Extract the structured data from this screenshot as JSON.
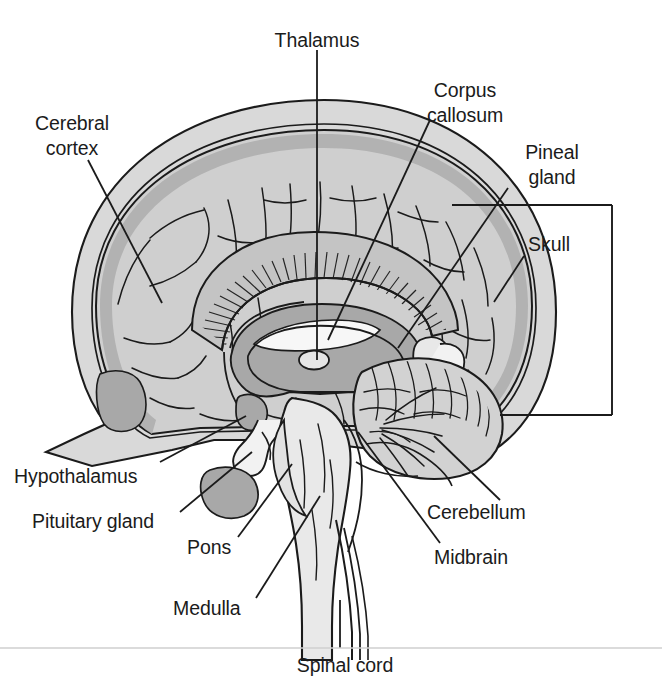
{
  "figure": {
    "background_color": "#ffffff",
    "divider_color": "#cfcfcf",
    "line_color": "#1b1b1b",
    "palette": {
      "skull_fill": "#d9d9d9",
      "cerebrum_fill": "#cfcfcf",
      "cortex_ribbon": "#b3b3b3",
      "deep_gray": "#a8a8a8",
      "corpus_callosum_fill": "#c4c4c4",
      "brainstem_fill": "#e8e8e8",
      "cerebellum_fill": "#d2d2d2",
      "ventricle_white": "#f5f5f5"
    }
  },
  "labels": {
    "cerebral_cortex": {
      "line1": "Cerebral",
      "line2": "cortex"
    },
    "thalamus": "Thalamus",
    "corpus_callosum": {
      "line1": "Corpus",
      "line2": "callosum"
    },
    "pineal_gland": {
      "line1": "Pineal",
      "line2": "gland"
    },
    "skull": "Skull",
    "cerebrum": "Cerebrum",
    "hypothalamus": "Hypothalamus",
    "pituitary_gland": "Pituitary gland",
    "pons": "Pons",
    "medulla": "Medulla",
    "spinal_cord": "Spinal cord",
    "cerebellum": "Cerebellum",
    "midbrain": "Midbrain"
  },
  "structures": [
    {
      "name": "Cerebral cortex",
      "region": "outer layer of cerebrum, left anterior"
    },
    {
      "name": "Thalamus",
      "region": "central, deep gray mass"
    },
    {
      "name": "Corpus callosum",
      "region": "arched hatched band above thalamus"
    },
    {
      "name": "Pineal gland",
      "region": "posterior to thalamus"
    },
    {
      "name": "Skull",
      "region": "outer bone band enclosing brain"
    },
    {
      "name": "Cerebrum",
      "region": "bracketed whole upper brain"
    },
    {
      "name": "Hypothalamus",
      "region": "below thalamus, anterior"
    },
    {
      "name": "Pituitary gland",
      "region": "inferior projection below hypothalamus"
    },
    {
      "name": "Pons",
      "region": "brainstem, bulging anterior segment"
    },
    {
      "name": "Midbrain",
      "region": "brainstem, superior segment"
    },
    {
      "name": "Medulla",
      "region": "brainstem, inferior segment"
    },
    {
      "name": "Cerebellum",
      "region": "posterior inferior, foliated"
    },
    {
      "name": "Spinal cord",
      "region": "descending continuation of medulla"
    }
  ]
}
